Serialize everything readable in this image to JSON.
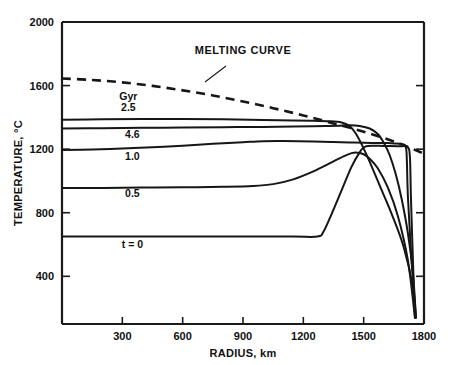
{
  "chart_data": {
    "type": "line",
    "title": "",
    "xlabel": "RADIUS, km",
    "ylabel": "TEMPERATURE, °C",
    "xlim": [
      0,
      1800
    ],
    "ylim": [
      100,
      2000
    ],
    "grid": false,
    "legend_position": "inline-annotations",
    "xticks": [
      300,
      600,
      900,
      1200,
      1500,
      1800
    ],
    "xtick_labels": [
      "300",
      "600",
      "900",
      "1200",
      "1500",
      "1800"
    ],
    "yticks": [
      400,
      800,
      1200,
      1600,
      2000
    ],
    "ytick_labels": [
      "400",
      "800",
      "1200",
      "1600",
      "2000"
    ],
    "annotations": [
      {
        "text": "MELTING CURVE",
        "x": 900,
        "y": 1800
      },
      {
        "text": "Gyr",
        "x": 330,
        "y": 1510
      },
      {
        "text": "2.5",
        "x": 330,
        "y": 1440
      },
      {
        "text": "4.6",
        "x": 350,
        "y": 1270
      },
      {
        "text": "1.0",
        "x": 350,
        "y": 1130
      },
      {
        "text": "0.5",
        "x": 350,
        "y": 900
      },
      {
        "text": "t = 0",
        "x": 350,
        "y": 580
      }
    ],
    "series": [
      {
        "name": "MELTING CURVE",
        "style": "dashed",
        "points": [
          [
            0,
            1645
          ],
          [
            150,
            1635
          ],
          [
            300,
            1620
          ],
          [
            450,
            1598
          ],
          [
            600,
            1570
          ],
          [
            750,
            1538
          ],
          [
            900,
            1500
          ],
          [
            1050,
            1458
          ],
          [
            1200,
            1412
          ],
          [
            1350,
            1362
          ],
          [
            1500,
            1310
          ],
          [
            1650,
            1248
          ],
          [
            1800,
            1172
          ]
        ]
      },
      {
        "name": "2.5",
        "style": "solid",
        "points": [
          [
            0,
            1385
          ],
          [
            200,
            1388
          ],
          [
            400,
            1390
          ],
          [
            600,
            1390
          ],
          [
            800,
            1388
          ],
          [
            1000,
            1384
          ],
          [
            1150,
            1380
          ],
          [
            1250,
            1378
          ],
          [
            1330,
            1376
          ],
          [
            1390,
            1368
          ],
          [
            1430,
            1345
          ],
          [
            1460,
            1300
          ],
          [
            1490,
            1230
          ],
          [
            1530,
            1120
          ],
          [
            1580,
            970
          ],
          [
            1640,
            790
          ],
          [
            1700,
            580
          ],
          [
            1745,
            330
          ],
          [
            1760,
            140
          ]
        ]
      },
      {
        "name": "4.6",
        "style": "solid",
        "points": [
          [
            0,
            1330
          ],
          [
            200,
            1332
          ],
          [
            400,
            1334
          ],
          [
            600,
            1336
          ],
          [
            800,
            1338
          ],
          [
            1000,
            1340
          ],
          [
            1150,
            1342
          ],
          [
            1250,
            1344
          ],
          [
            1320,
            1346
          ],
          [
            1380,
            1348
          ],
          [
            1430,
            1350
          ],
          [
            1480,
            1346
          ],
          [
            1530,
            1330
          ],
          [
            1570,
            1295
          ],
          [
            1600,
            1240
          ],
          [
            1630,
            1160
          ],
          [
            1660,
            1040
          ],
          [
            1690,
            880
          ],
          [
            1720,
            670
          ],
          [
            1745,
            420
          ],
          [
            1760,
            140
          ]
        ]
      },
      {
        "name": "1.0",
        "style": "solid",
        "points": [
          [
            0,
            1195
          ],
          [
            150,
            1198
          ],
          [
            300,
            1204
          ],
          [
            450,
            1212
          ],
          [
            600,
            1222
          ],
          [
            750,
            1234
          ],
          [
            900,
            1244
          ],
          [
            1000,
            1250
          ],
          [
            1100,
            1251
          ],
          [
            1250,
            1248
          ],
          [
            1350,
            1245
          ],
          [
            1430,
            1242
          ],
          [
            1500,
            1240
          ],
          [
            1620,
            1238
          ],
          [
            1690,
            1232
          ],
          [
            1710,
            1210
          ],
          [
            1715,
            1120
          ],
          [
            1720,
            900
          ],
          [
            1735,
            560
          ],
          [
            1758,
            140
          ]
        ]
      },
      {
        "name": "0.5",
        "style": "solid",
        "points": [
          [
            0,
            955
          ],
          [
            200,
            956
          ],
          [
            400,
            958
          ],
          [
            600,
            960
          ],
          [
            800,
            963
          ],
          [
            950,
            968
          ],
          [
            1050,
            980
          ],
          [
            1150,
            1010
          ],
          [
            1250,
            1060
          ],
          [
            1330,
            1110
          ],
          [
            1400,
            1155
          ],
          [
            1440,
            1175
          ],
          [
            1470,
            1178
          ],
          [
            1500,
            1168
          ],
          [
            1530,
            1140
          ],
          [
            1570,
            1080
          ],
          [
            1620,
            960
          ],
          [
            1670,
            780
          ],
          [
            1720,
            500
          ],
          [
            1755,
            140
          ]
        ]
      },
      {
        "name": "t = 0",
        "style": "solid",
        "points": [
          [
            0,
            650
          ],
          [
            300,
            650
          ],
          [
            600,
            650
          ],
          [
            900,
            650
          ],
          [
            1150,
            650
          ],
          [
            1270,
            650
          ],
          [
            1300,
            680
          ],
          [
            1340,
            790
          ],
          [
            1390,
            940
          ],
          [
            1440,
            1090
          ],
          [
            1480,
            1180
          ],
          [
            1500,
            1210
          ],
          [
            1520,
            1220
          ],
          [
            1545,
            1222
          ],
          [
            1600,
            1220
          ],
          [
            1680,
            1218
          ],
          [
            1718,
            1214
          ],
          [
            1730,
            1150
          ],
          [
            1735,
            900
          ],
          [
            1745,
            500
          ],
          [
            1755,
            140
          ]
        ]
      }
    ]
  }
}
